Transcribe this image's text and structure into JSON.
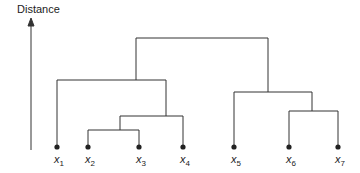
{
  "axis": {
    "label": "Distance"
  },
  "leaves": [
    {
      "name": "x",
      "sub": "1",
      "x": 57
    },
    {
      "name": "x",
      "sub": "2",
      "x": 88
    },
    {
      "name": "x",
      "sub": "3",
      "x": 139
    },
    {
      "name": "x",
      "sub": "4",
      "x": 183
    },
    {
      "name": "x",
      "sub": "5",
      "x": 234
    },
    {
      "name": "x",
      "sub": "6",
      "x": 289
    },
    {
      "name": "x",
      "sub": "7",
      "x": 338
    }
  ],
  "merges": [
    {
      "members": [
        "x2",
        "x3"
      ],
      "height_y": 130
    },
    {
      "members": [
        "x2",
        "x3",
        "x4"
      ],
      "height_y": 116
    },
    {
      "members": [
        "x1",
        "x2",
        "x3",
        "x4"
      ],
      "height_y": 80
    },
    {
      "members": [
        "x6",
        "x7"
      ],
      "height_y": 111
    },
    {
      "members": [
        "x5",
        "x6",
        "x7"
      ],
      "height_y": 92
    },
    {
      "members": [
        "x1",
        "x2",
        "x3",
        "x4",
        "x5",
        "x6",
        "x7"
      ],
      "height_y": 38
    }
  ],
  "colors": {
    "line": "#333333"
  }
}
